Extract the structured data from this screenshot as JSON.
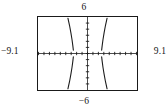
{
  "figure": {
    "title": "",
    "window_labels": {
      "ymax": "6",
      "ymin": "−6",
      "xmin": "−9.1",
      "xmax": "9.1"
    }
  },
  "chart_data": {
    "type": "line",
    "title": "",
    "xlabel": "",
    "ylabel": "",
    "xlim": [
      -9.1,
      9.1
    ],
    "ylim": [
      -6,
      6
    ],
    "grid": false,
    "legend": null,
    "axes": {
      "x_axis_visible": true,
      "y_axis_visible": true,
      "x_axis_style": "dotted-ticks",
      "y_axis_style": "dotted-ticks",
      "x_tick_count": 18,
      "y_tick_count": 12,
      "x_tick_step": 1,
      "y_tick_step": 1
    },
    "series": [
      {
        "name": "branch-upper-left",
        "quadrant": "II",
        "points": [
          [
            -3.6,
            5.8
          ],
          [
            -3.3,
            4.6
          ],
          [
            -3.05,
            3.4
          ],
          [
            -2.85,
            2.3
          ],
          [
            -2.7,
            1.3
          ],
          [
            -2.6,
            0.55
          ]
        ]
      },
      {
        "name": "branch-upper-right",
        "quadrant": "I",
        "points": [
          [
            2.6,
            0.55
          ],
          [
            2.7,
            1.3
          ],
          [
            2.85,
            2.3
          ],
          [
            3.05,
            3.4
          ],
          [
            3.3,
            4.6
          ],
          [
            3.6,
            5.8
          ]
        ]
      },
      {
        "name": "branch-lower-left",
        "quadrant": "III",
        "points": [
          [
            -3.6,
            -5.8
          ],
          [
            -3.3,
            -4.6
          ],
          [
            -3.05,
            -3.4
          ],
          [
            -2.85,
            -2.3
          ],
          [
            -2.7,
            -1.3
          ],
          [
            -2.6,
            -0.55
          ]
        ]
      },
      {
        "name": "branch-lower-right",
        "quadrant": "IV",
        "points": [
          [
            2.6,
            -0.55
          ],
          [
            2.7,
            -1.3
          ],
          [
            2.85,
            -2.3
          ],
          [
            3.05,
            -3.4
          ],
          [
            3.3,
            -4.6
          ],
          [
            3.6,
            -5.8
          ]
        ]
      }
    ],
    "colors": {
      "curve": "#1a1a1a",
      "axis": "#1a1a1a",
      "frame": "#1a1a1a",
      "background": "#ffffff"
    }
  }
}
